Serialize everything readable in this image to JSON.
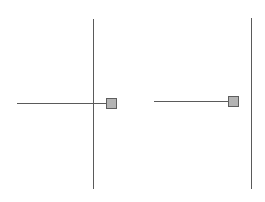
{
  "colors": {
    "background": "#ffffff",
    "line": "#5a5a5a",
    "handle_fill": "#b4b4b4",
    "handle_border": "#5e5e5e"
  },
  "diagrams": [
    {
      "name": "left-connector",
      "vertical_line": {
        "x": 93,
        "y1": 19,
        "y2": 189
      },
      "horizontal_line": {
        "y": 103,
        "x1": 17,
        "x2": 106
      },
      "handle": {
        "x": 106,
        "y": 98,
        "size": 11
      }
    },
    {
      "name": "right-connector",
      "vertical_line": {
        "x": 251,
        "y1": 18,
        "y2": 189
      },
      "horizontal_line": {
        "y": 101,
        "x1": 154,
        "x2": 228
      },
      "handle": {
        "x": 228,
        "y": 96,
        "size": 11
      }
    }
  ]
}
